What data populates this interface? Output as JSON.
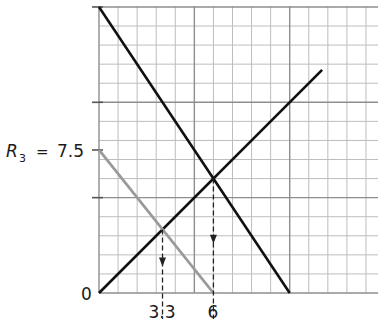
{
  "chart_data": {
    "type": "line",
    "title": "",
    "xlabel": "",
    "ylabel": "",
    "xlim": [
      0,
      14.5
    ],
    "ylim": [
      0,
      15
    ],
    "grid": true,
    "grid_minor_step": 1,
    "grid_major_step": 5,
    "series": [
      {
        "name": "descending black line",
        "color": "#111111",
        "x": [
          0,
          10
        ],
        "y": [
          15,
          0
        ]
      },
      {
        "name": "ascending black line",
        "color": "#111111",
        "x": [
          0,
          11.7
        ],
        "y": [
          0,
          11.7
        ]
      },
      {
        "name": "gray line",
        "color": "#9a9a9a",
        "x": [
          0,
          6
        ],
        "y": [
          7.5,
          0
        ]
      }
    ],
    "annotations": [
      {
        "type": "dashed-arrow",
        "from": [
          3.33,
          3.33
        ],
        "to": [
          3.33,
          0
        ],
        "label": "3.3"
      },
      {
        "type": "dashed-arrow",
        "from": [
          6,
          6
        ],
        "to": [
          6,
          0
        ],
        "label": "6"
      }
    ],
    "y_ticks": [
      5,
      7.5,
      10,
      15
    ],
    "labels": {
      "origin": "0",
      "r3_symbol": "R",
      "r3_subscript": "3",
      "r3_equals": "=",
      "r3_value": "7.5",
      "x_label_1": "3.3",
      "x_label_2": "6"
    }
  }
}
